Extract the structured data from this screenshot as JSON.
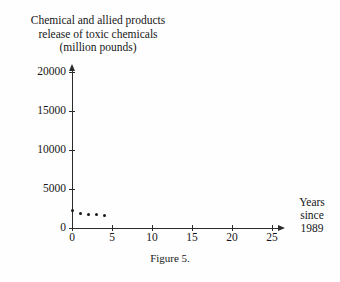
{
  "chart_data": {
    "type": "scatter",
    "title": "Chemical and allied products release of toxic chemicals (million pounds)",
    "title_lines": [
      "Chemical and allied products",
      "release of toxic chemicals",
      "(million pounds)"
    ],
    "xlabel": "Years since 1989",
    "xlabel_lines": [
      "Years",
      "since",
      "1989"
    ],
    "ylabel": "million pounds",
    "x": [
      0,
      1,
      2,
      3,
      4
    ],
    "values": [
      2200,
      1800,
      1750,
      1700,
      1650
    ],
    "series": [
      {
        "name": "Release of toxic chemicals",
        "values": [
          2200,
          1800,
          1750,
          1700,
          1650
        ]
      }
    ],
    "xlim": [
      0,
      25
    ],
    "ylim": [
      0,
      20000
    ],
    "xticks": [
      0,
      5,
      10,
      15,
      20,
      25
    ],
    "xtick_labels": [
      "0",
      "5",
      "10",
      "15",
      "20",
      "25"
    ],
    "yticks": [
      0,
      5000,
      10000,
      15000,
      20000
    ],
    "ytick_labels": [
      "0",
      "5000",
      "10000",
      "15000",
      "20000"
    ],
    "grid": false,
    "legend": false,
    "marker": "filled-circle",
    "marker_color": "#181818",
    "axis_color": "#2b2b2b",
    "background_color": "#fefefe"
  },
  "caption": "Figure 5."
}
